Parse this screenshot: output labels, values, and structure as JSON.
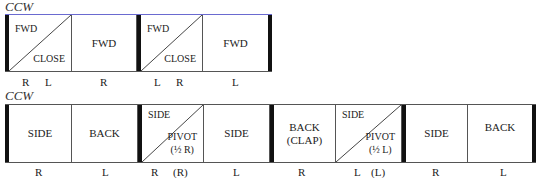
{
  "figures": [
    {
      "title": "CCW",
      "cells": [
        {
          "type": "split",
          "top_left": "FWD",
          "bottom_right": "CLOSE",
          "bottom_right_2": "",
          "feet": [
            "R",
            "L"
          ]
        },
        {
          "type": "single",
          "label": "FWD",
          "label_2": "",
          "feet": [
            "R"
          ]
        },
        {
          "type": "split",
          "top_left": "FWD",
          "bottom_right": "CLOSE",
          "bottom_right_2": "",
          "feet": [
            "L",
            "R"
          ]
        },
        {
          "type": "single",
          "label": "FWD",
          "label_2": "",
          "feet": [
            "L"
          ]
        }
      ]
    },
    {
      "title": "CCW",
      "cells": [
        {
          "type": "single",
          "label": "SIDE",
          "label_2": "",
          "feet": [
            "R"
          ]
        },
        {
          "type": "single",
          "label": "BACK",
          "label_2": "",
          "feet": [
            "L"
          ]
        },
        {
          "type": "split",
          "top_left": "SIDE",
          "bottom_right": "PIVOT",
          "bottom_right_2": "(½ R)",
          "feet": [
            "R",
            "(R)"
          ]
        },
        {
          "type": "single",
          "label": "SIDE",
          "label_2": "",
          "feet": [
            "L"
          ]
        },
        {
          "type": "single",
          "label": "BACK",
          "label_2": "(CLAP)",
          "feet": [
            "R"
          ]
        },
        {
          "type": "split",
          "top_left": "SIDE",
          "bottom_right": "PIVOT",
          "bottom_right_2": "(½ L)",
          "feet": [
            "L",
            "(L)"
          ]
        },
        {
          "type": "single",
          "label": "SIDE",
          "label_2": "",
          "feet": [
            "R"
          ]
        },
        {
          "type": "single",
          "label": "BACK",
          "label_2": "",
          "feet": [
            "L"
          ]
        }
      ]
    }
  ],
  "colors": {
    "thick_bar": "#111111",
    "line": "#555555",
    "top_border_tint": "#6a6ad0"
  }
}
